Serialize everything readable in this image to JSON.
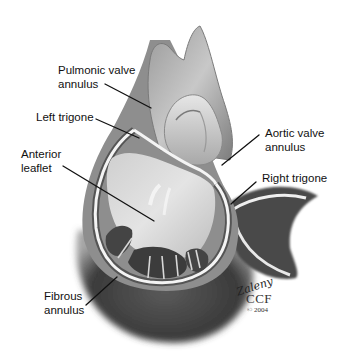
{
  "figure": {
    "style": "grayscale medical illustration",
    "colors": {
      "background": "#ffffff",
      "tissue_dark": "#3a3a3a",
      "tissue_mid": "#8a8a8a",
      "tissue_light": "#d6d6d6",
      "annulus_highlight": "#f4f4f4",
      "label_text": "#111111",
      "leader_line": "#111111"
    }
  },
  "labels": [
    {
      "id": "pulmonic-valve-annulus",
      "line1": "Pulmonic valve",
      "line2": "annulus"
    },
    {
      "id": "left-trigone",
      "line1": "Left trigone"
    },
    {
      "id": "anterior-leaflet",
      "line1": "Anterior",
      "line2": "leaflet"
    },
    {
      "id": "aortic-valve-annulus",
      "line1": "Aortic valve",
      "line2": "annulus"
    },
    {
      "id": "right-trigone",
      "line1": "Right trigone"
    },
    {
      "id": "fibrous-annulus",
      "line1": "Fibrous",
      "line2": "annulus"
    }
  ],
  "credit": {
    "signature": "Zaleny",
    "organization": "CCF",
    "copyright": "© 2004"
  }
}
